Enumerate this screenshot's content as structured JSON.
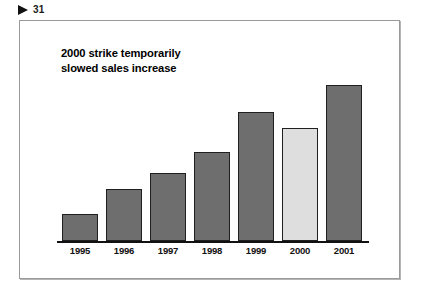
{
  "header": {
    "marker_icon": "play-triangle-icon",
    "page_number": "31"
  },
  "chart_data": {
    "type": "bar",
    "title": "2000 strike temporarily slowed sales increase",
    "title_lines": [
      "2000 strike temporarily",
      "slowed sales increase"
    ],
    "categories": [
      "1995",
      "1996",
      "1997",
      "1998",
      "1999",
      "2000",
      "2001"
    ],
    "values": [
      27,
      52,
      68,
      89,
      129,
      113,
      156
    ],
    "bar_colors": [
      "#6e6e6e",
      "#6e6e6e",
      "#6e6e6e",
      "#6e6e6e",
      "#6e6e6e",
      "#dedede",
      "#6e6e6e"
    ],
    "highlight_category": "2000",
    "xlabel": "",
    "ylabel": "",
    "ylim": [
      0,
      175
    ],
    "grid": false,
    "legend": false,
    "axis_color": "#111111",
    "bar_border_color": "#1f1f1f"
  }
}
